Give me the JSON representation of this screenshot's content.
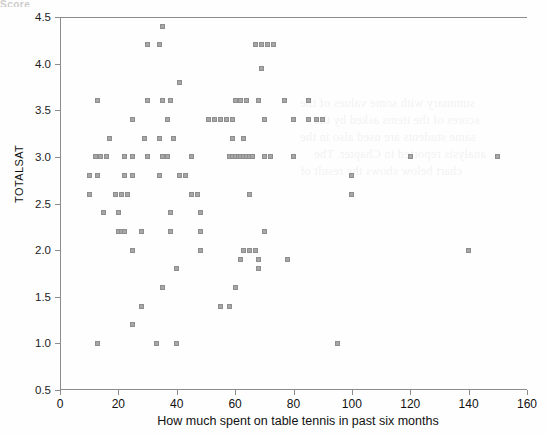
{
  "top_cropped_text": "Score",
  "bleed_text": [
    "summary with some values of the",
    "scores of the items asked by the",
    "same students are used also in the",
    "analysis reported in Chapter. The",
    "chart below shows the result of"
  ],
  "chart_data": {
    "type": "scatter",
    "title": "",
    "xlabel": "How much spent on table tennis in past six months",
    "ylabel": "TOTALSAT",
    "xlim": [
      0,
      160
    ],
    "ylim": [
      0.5,
      4.5
    ],
    "xticks": [
      0,
      20,
      40,
      60,
      80,
      100,
      120,
      140,
      160
    ],
    "yticks": [
      0.5,
      1.0,
      1.5,
      2.0,
      2.5,
      3.0,
      3.5,
      4.0,
      4.5
    ],
    "grid": false,
    "legend": "none",
    "marker": "square",
    "marker_color": "#a7a7a7",
    "marker_size": 5,
    "points": [
      [
        35,
        4.4
      ],
      [
        30,
        4.2
      ],
      [
        34,
        4.2
      ],
      [
        67,
        4.2
      ],
      [
        69,
        4.2
      ],
      [
        71,
        4.2
      ],
      [
        73,
        4.2
      ],
      [
        69,
        3.95
      ],
      [
        41,
        3.8
      ],
      [
        13,
        3.6
      ],
      [
        13,
        3.6
      ],
      [
        30,
        3.6
      ],
      [
        35,
        3.6
      ],
      [
        38,
        3.6
      ],
      [
        60,
        3.6
      ],
      [
        62,
        3.6
      ],
      [
        64,
        3.6
      ],
      [
        68,
        3.6
      ],
      [
        77,
        3.6
      ],
      [
        85,
        3.6
      ],
      [
        25,
        3.4
      ],
      [
        37,
        3.4
      ],
      [
        51,
        3.4
      ],
      [
        53,
        3.4
      ],
      [
        55,
        3.4
      ],
      [
        57,
        3.4
      ],
      [
        59,
        3.4
      ],
      [
        70,
        3.4
      ],
      [
        80,
        3.4
      ],
      [
        85,
        3.4
      ],
      [
        88,
        3.4
      ],
      [
        90,
        3.4
      ],
      [
        17,
        3.2
      ],
      [
        29,
        3.2
      ],
      [
        34,
        3.2
      ],
      [
        39,
        3.2
      ],
      [
        59,
        3.2
      ],
      [
        63,
        3.2
      ],
      [
        12,
        3.0
      ],
      [
        14,
        3.0
      ],
      [
        16,
        3.0
      ],
      [
        22,
        3.0
      ],
      [
        25,
        3.0
      ],
      [
        30,
        3.0
      ],
      [
        35,
        3.0
      ],
      [
        37,
        3.0
      ],
      [
        45,
        3.0
      ],
      [
        58,
        3.0
      ],
      [
        59,
        3.0
      ],
      [
        60,
        3.0
      ],
      [
        61,
        3.0
      ],
      [
        62,
        3.0
      ],
      [
        63,
        3.0
      ],
      [
        64,
        3.0
      ],
      [
        65,
        3.0
      ],
      [
        66,
        3.0
      ],
      [
        70,
        3.0
      ],
      [
        72,
        3.0
      ],
      [
        80,
        3.0
      ],
      [
        120,
        3.0
      ],
      [
        150,
        3.0
      ],
      [
        10,
        2.8
      ],
      [
        13,
        2.8
      ],
      [
        22,
        2.8
      ],
      [
        25,
        2.8
      ],
      [
        34,
        2.8
      ],
      [
        41,
        2.8
      ],
      [
        43,
        2.8
      ],
      [
        100,
        2.8
      ],
      [
        10,
        2.6
      ],
      [
        19,
        2.6
      ],
      [
        21,
        2.6
      ],
      [
        23,
        2.6
      ],
      [
        45,
        2.6
      ],
      [
        47,
        2.6
      ],
      [
        65,
        2.6
      ],
      [
        100,
        2.6
      ],
      [
        15,
        2.4
      ],
      [
        20,
        2.4
      ],
      [
        38,
        2.4
      ],
      [
        48,
        2.4
      ],
      [
        20,
        2.2
      ],
      [
        21,
        2.2
      ],
      [
        22,
        2.2
      ],
      [
        28,
        2.2
      ],
      [
        38,
        2.2
      ],
      [
        48,
        2.2
      ],
      [
        70,
        2.2
      ],
      [
        25,
        2.0
      ],
      [
        48,
        2.0
      ],
      [
        63,
        2.0
      ],
      [
        65,
        2.0
      ],
      [
        67,
        2.0
      ],
      [
        140,
        2.0
      ],
      [
        62,
        1.9
      ],
      [
        68,
        1.9
      ],
      [
        78,
        1.9
      ],
      [
        40,
        1.8
      ],
      [
        68,
        1.8
      ],
      [
        35,
        1.6
      ],
      [
        60,
        1.6
      ],
      [
        28,
        1.4
      ],
      [
        55,
        1.4
      ],
      [
        58,
        1.4
      ],
      [
        25,
        1.2
      ],
      [
        13,
        1.0
      ],
      [
        13,
        1.0
      ],
      [
        33,
        1.0
      ],
      [
        40,
        1.0
      ],
      [
        95,
        1.0
      ]
    ]
  }
}
